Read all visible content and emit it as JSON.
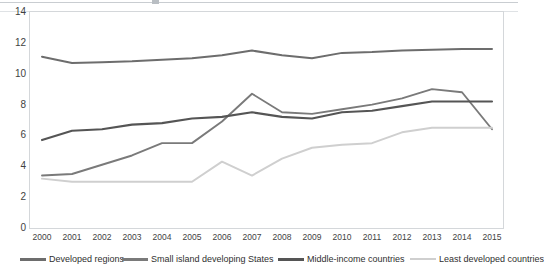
{
  "chart_data": {
    "type": "line",
    "title": "",
    "subtitle": "",
    "xlabel": "",
    "ylabel": "",
    "x": [
      "2000",
      "2001",
      "2002",
      "2003",
      "2004",
      "2005",
      "2006",
      "2007",
      "2008",
      "2009",
      "2010",
      "2011",
      "2012",
      "2013",
      "2014",
      "2015"
    ],
    "categories": [
      "2000",
      "2001",
      "2002",
      "2003",
      "2004",
      "2005",
      "2006",
      "2007",
      "2008",
      "2009",
      "2010",
      "2011",
      "2012",
      "2013",
      "2014",
      "2015"
    ],
    "ylim": [
      0,
      14
    ],
    "ytick_step": 2,
    "yticks": [
      "0",
      "2",
      "4",
      "6",
      "8",
      "10",
      "12",
      "14"
    ],
    "grid": false,
    "legend_position": "bottom",
    "series": [
      {
        "name": "Developed regions",
        "color": "#6d6d6d",
        "values": [
          11.1,
          10.7,
          10.75,
          10.8,
          10.9,
          11.0,
          11.2,
          11.5,
          11.2,
          11.0,
          11.35,
          11.4,
          11.5,
          11.55,
          11.6,
          11.6
        ]
      },
      {
        "name": "Small island developing States",
        "color": "#7a7a7a",
        "values": [
          3.4,
          3.5,
          4.1,
          4.7,
          5.5,
          5.5,
          6.9,
          8.7,
          7.5,
          7.4,
          7.7,
          8.0,
          8.4,
          9.0,
          8.8,
          6.4
        ]
      },
      {
        "name": "Middle-income countries",
        "color": "#555555",
        "values": [
          5.7,
          6.3,
          6.4,
          6.7,
          6.8,
          7.1,
          7.2,
          7.5,
          7.2,
          7.1,
          7.5,
          7.6,
          7.9,
          8.2,
          8.2,
          8.2
        ]
      },
      {
        "name": "Least developed countries",
        "color": "#cfcfcf",
        "values": [
          3.2,
          3.0,
          3.0,
          3.0,
          3.0,
          3.0,
          4.3,
          3.4,
          4.5,
          5.2,
          5.4,
          5.5,
          6.2,
          6.5,
          6.5,
          6.5
        ]
      }
    ]
  },
  "legend": {
    "items": [
      {
        "label": "Developed regions",
        "color": "#6d6d6d"
      },
      {
        "label": "Small island developing States",
        "color": "#7a7a7a"
      },
      {
        "label": "Middle-income countries",
        "color": "#555555"
      },
      {
        "label": "Least developed countries",
        "color": "#cfcfcf"
      }
    ]
  },
  "axes": {
    "y_ticks": [
      "14",
      "12",
      "10",
      "8",
      "6",
      "4",
      "2",
      "0"
    ],
    "x_ticks": [
      "2000",
      "2001",
      "2002",
      "2003",
      "2004",
      "2005",
      "2006",
      "2007",
      "2008",
      "2009",
      "2010",
      "2011",
      "2012",
      "2013",
      "2014",
      "2015"
    ]
  },
  "colors": {
    "plot_border": "#d4d7da",
    "axis_text": "#3f3f3f",
    "background": "#ffffff"
  }
}
